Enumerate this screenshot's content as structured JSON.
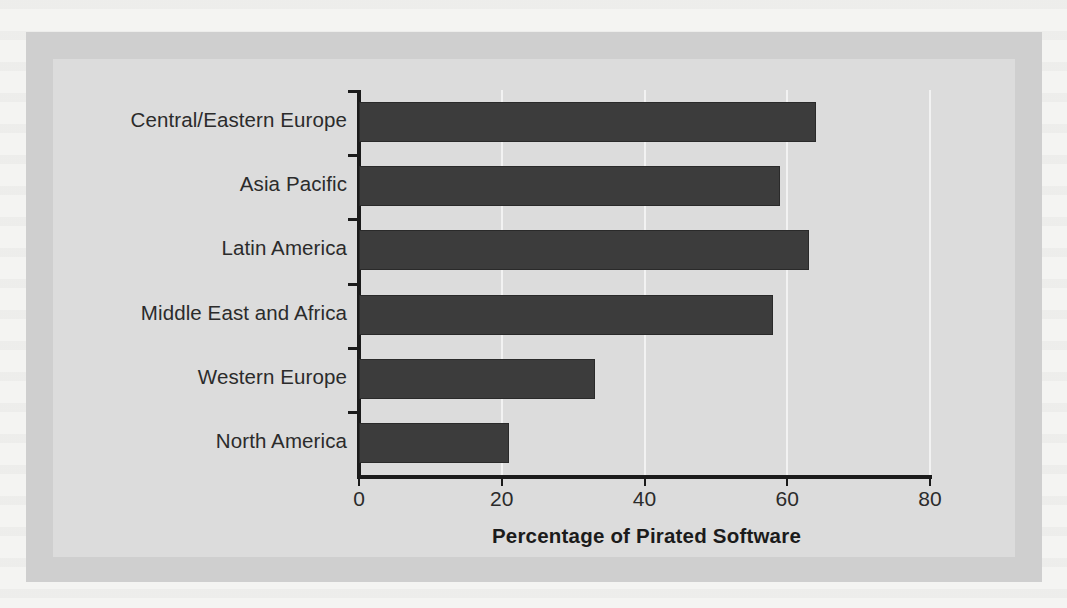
{
  "figure": {
    "background_color": "#f4f4f2",
    "frame_color": "#cfcfcf",
    "panel_color": "#dcdcdc",
    "bar_color": "#3c3c3c",
    "axis_color": "#1b1b1b",
    "gridline_color": "#f2f2f2"
  },
  "chart_data": {
    "type": "bar",
    "orientation": "horizontal",
    "title": "",
    "xlabel": "Percentage of Pirated Software",
    "ylabel": "",
    "xlim": [
      0,
      80
    ],
    "xticks": [
      0,
      20,
      40,
      60,
      80
    ],
    "xtick_labels": [
      "0",
      "20",
      "40",
      "60",
      "80"
    ],
    "grid": true,
    "grid_axis": "x",
    "legend": false,
    "categories": [
      "Central/Eastern Europe",
      "Asia Pacific",
      "Latin America",
      "Middle East and Africa",
      "Western Europe",
      "North America"
    ],
    "values": [
      64,
      59,
      63,
      58,
      33,
      21
    ],
    "series": [
      {
        "name": "Percentage of Pirated Software",
        "values": [
          64,
          59,
          63,
          58,
          33,
          21
        ]
      }
    ]
  }
}
